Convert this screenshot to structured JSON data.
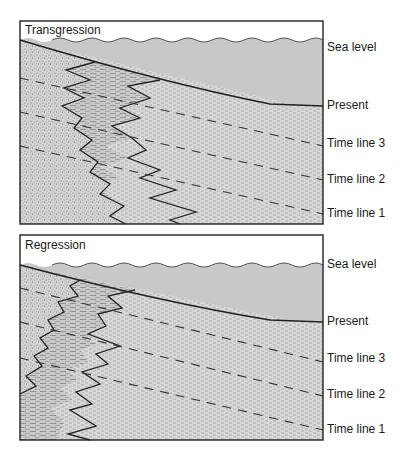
{
  "colors": {
    "water": "#c8c8c8",
    "sand": "#d2d2d2",
    "shale": "#c4c4c4",
    "outline": "#222222",
    "background": "#ffffff"
  },
  "panels": [
    {
      "id": "transgression",
      "title": "Transgression",
      "labels": {
        "sea_level": "Sea level",
        "present": "Present",
        "time_line_3": "Time line 3",
        "time_line_2": "Time line 2",
        "time_line_1": "Time line 1"
      }
    },
    {
      "id": "regression",
      "title": "Regression",
      "labels": {
        "sea_level": "Sea level",
        "present": "Present",
        "time_line_3": "Time line 3",
        "time_line_2": "Time line 2",
        "time_line_1": "Time line 1"
      }
    }
  ],
  "legend_semantics": {
    "stippled_fill": "sandstone",
    "dashed_fill_light": "siltstone",
    "dashed_fill_dense": "shale",
    "wavy_line": "sea surface",
    "dashed_lines": "time lines"
  }
}
